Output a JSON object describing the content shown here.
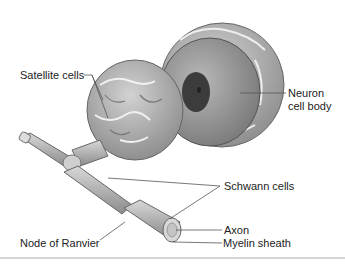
{
  "diagram": {
    "labels": {
      "satellite_cells": "Satellite cells",
      "neuron_line1": "Neuron",
      "neuron_line2": "cell body",
      "schwann_cells": "Schwann cells",
      "axon": "Axon",
      "myelin_sheath": "Myelin sheath",
      "node_of_ranvier": "Node of Ranvier"
    },
    "colors": {
      "background": "#ffffff",
      "tissue_light": "#c9c9c9",
      "tissue_mid": "#9d9d9d",
      "tissue_dark": "#6f6f6f",
      "nucleus": "#3c3c3c",
      "leader_line": "#555555",
      "text": "#222222"
    }
  }
}
